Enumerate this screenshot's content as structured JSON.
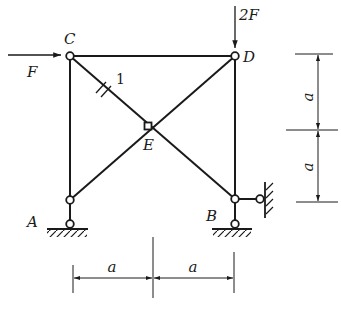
{
  "figure": {
    "type": "truss-diagram",
    "colors": {
      "ink": "#1a1a1a",
      "background": "#ffffff"
    },
    "nodes": {
      "A": {
        "label": "A"
      },
      "B": {
        "label": "B"
      },
      "C": {
        "label": "C"
      },
      "D": {
        "label": "D"
      },
      "E": {
        "label": "E"
      }
    },
    "members": [
      {
        "from": "C",
        "to": "D"
      },
      {
        "from": "C",
        "to": "A"
      },
      {
        "from": "D",
        "to": "B"
      },
      {
        "from": "C",
        "to": "B"
      },
      {
        "from": "D",
        "to": "A"
      }
    ],
    "member_marker": {
      "member": "CE",
      "label": "1"
    },
    "loads": [
      {
        "node": "C",
        "direction": "right",
        "label": "F"
      },
      {
        "node": "D",
        "direction": "down",
        "label": "2F"
      }
    ],
    "supports": [
      {
        "node": "A",
        "type": "pin-link-vertical"
      },
      {
        "node": "B",
        "type": "pin-link-vertical"
      },
      {
        "node": "B",
        "type": "link-horizontal-to-wall"
      }
    ],
    "dimensions": {
      "horizontal": [
        {
          "label": "a"
        },
        {
          "label": "a"
        }
      ],
      "vertical": [
        {
          "label": "a"
        },
        {
          "label": "a"
        }
      ]
    }
  }
}
